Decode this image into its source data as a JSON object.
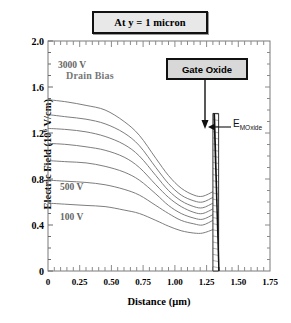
{
  "figure": {
    "title_box": "At y = 1 micron",
    "gate_oxide_box": "Gate Oxide",
    "oxide_field_label": "E",
    "oxide_field_sub": "MOxide",
    "drain_bias_caption": "Drain Bias"
  },
  "axes": {
    "ylabel_text": "Electric Field  (10",
    "ylabel_exp": "6",
    "ylabel_tail": " V/cm)",
    "xlabel": "Distance (µm)",
    "yticks": [
      "2.0",
      "1.6",
      "1.2",
      "0.8",
      "0.4",
      "0"
    ],
    "xticks": [
      "0",
      "0.25",
      "0.50",
      "0.75",
      "1.00",
      "1.25",
      "1.50",
      "1.75"
    ]
  },
  "chart_data": {
    "type": "line",
    "title": "At y = 1 micron",
    "xlabel": "Distance (µm)",
    "ylabel": "Electric Field (10^6 V/cm)",
    "xlim": [
      0,
      1.75
    ],
    "ylim": [
      0,
      2.0
    ],
    "grid": false,
    "legend": "inline-labels",
    "annotations": [
      {
        "text": "Drain Bias",
        "x": 0.28,
        "y": 1.67
      },
      {
        "text": "3000 V",
        "x": 0.14,
        "y": 1.53
      },
      {
        "text": "500 V",
        "x": 0.14,
        "y": 0.76
      },
      {
        "text": "100 V",
        "x": 0.14,
        "y": 0.5
      },
      {
        "text": "Gate Oxide",
        "x": 1.1,
        "y": 1.82
      },
      {
        "text": "E_MOxide",
        "x": 1.45,
        "y": 1.33
      }
    ],
    "oxide_region": {
      "x_start": 1.3,
      "x_end": 1.345,
      "y_top": 1.37,
      "y_bottom": 0.0,
      "hatched": true,
      "note": "Gate oxide slab; field E_MOxide at top ~1.37"
    },
    "x": [
      0.0,
      0.15,
      0.3,
      0.45,
      0.6,
      0.72,
      0.85,
      0.95,
      1.05,
      1.15,
      1.22,
      1.3
    ],
    "series": [
      {
        "name": "3000 V",
        "values": [
          1.49,
          1.47,
          1.44,
          1.4,
          1.3,
          1.18,
          0.98,
          0.83,
          0.72,
          0.66,
          0.65,
          0.69
        ]
      },
      {
        "name": "2500 V",
        "values": [
          1.36,
          1.34,
          1.32,
          1.28,
          1.2,
          1.09,
          0.9,
          0.76,
          0.66,
          0.61,
          0.6,
          0.64
        ]
      },
      {
        "name": "2000 V",
        "values": [
          1.24,
          1.23,
          1.21,
          1.17,
          1.1,
          1.0,
          0.83,
          0.7,
          0.61,
          0.56,
          0.55,
          0.59
        ]
      },
      {
        "name": "1500 V",
        "values": [
          1.11,
          1.1,
          1.08,
          1.05,
          0.99,
          0.9,
          0.75,
          0.64,
          0.56,
          0.51,
          0.5,
          0.54
        ]
      },
      {
        "name": "1000 V",
        "values": [
          0.96,
          0.95,
          0.94,
          0.91,
          0.86,
          0.79,
          0.67,
          0.57,
          0.5,
          0.46,
          0.45,
          0.49
        ]
      },
      {
        "name": "500 V",
        "values": [
          0.79,
          0.78,
          0.77,
          0.75,
          0.71,
          0.66,
          0.57,
          0.5,
          0.44,
          0.41,
          0.4,
          0.44
        ]
      },
      {
        "name": "100 V",
        "values": [
          0.59,
          0.58,
          0.57,
          0.56,
          0.53,
          0.5,
          0.44,
          0.39,
          0.35,
          0.33,
          0.33,
          0.36
        ]
      }
    ],
    "oxide_drop_line": {
      "x": [
        1.3,
        1.345
      ],
      "y": [
        1.37,
        0.0
      ],
      "note": "steep field drop across oxide to substrate"
    }
  }
}
